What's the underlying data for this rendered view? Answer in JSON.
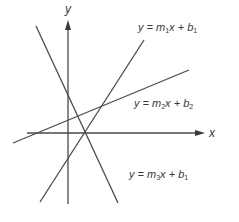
{
  "diagram": {
    "type": "lines-in-plane",
    "axes": {
      "x_label": "x",
      "y_label": "y",
      "stroke_color": "#4a4a4a"
    },
    "lines": [
      {
        "id": "line1",
        "label_prefix": "y = m",
        "m_sub": "1",
        "mid": "x + b",
        "b_sub": "1",
        "x1": 40,
        "y1": 202,
        "x2": 144,
        "y2": 40,
        "label_x": 138,
        "label_y": 22
      },
      {
        "id": "line2",
        "label_prefix": "y = m",
        "m_sub": "2",
        "mid": "x + b",
        "b_sub": "2",
        "x1": 13,
        "y1": 143,
        "x2": 189,
        "y2": 70,
        "label_x": 134,
        "label_y": 98
      },
      {
        "id": "line3",
        "label_prefix": "y = m",
        "m_sub": "3",
        "mid": "x + b",
        "b_sub": "1",
        "x1": 36,
        "y1": 26,
        "x2": 118,
        "y2": 203,
        "label_x": 129,
        "label_y": 169
      }
    ],
    "line_color": "#4a4a4a"
  }
}
